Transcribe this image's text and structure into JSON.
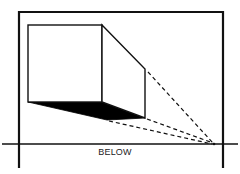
{
  "diagram": {
    "label": "BELOW",
    "colors": {
      "stroke": "#111111",
      "shadow_fill": "#000000",
      "background": "#ffffff"
    },
    "frame": {
      "left": 19,
      "right": 223,
      "top": 12,
      "bottom": 168
    },
    "horizon": {
      "y": 144,
      "x1": 2,
      "x2": 238
    },
    "vanishing_point": {
      "x": 214,
      "y": 144
    },
    "box": {
      "front_face": {
        "x1": 28,
        "y1": 25,
        "x2": 102,
        "y2": 102
      },
      "back_edge": {
        "x": 145,
        "top": 69,
        "bottom": 118
      },
      "shadow_left_bottom": {
        "x": 107,
        "y": 120
      }
    }
  }
}
